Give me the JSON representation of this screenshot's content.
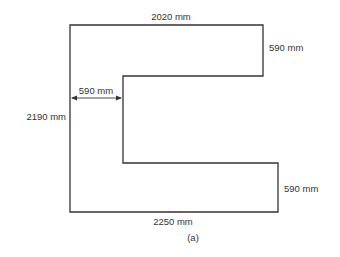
{
  "diagram": {
    "type": "floor-plan-outline",
    "shape": "E-shaped / C-shaped outline",
    "stroke_color": "#333333",
    "background": "#ffffff",
    "dimensions": {
      "top": "2020 mm",
      "top_arm_height": "590 mm",
      "inner_width": "590 mm",
      "left_height": "2190 mm",
      "bottom_arm_height": "590 mm",
      "bottom": "2250 mm"
    },
    "caption": "(a)"
  }
}
